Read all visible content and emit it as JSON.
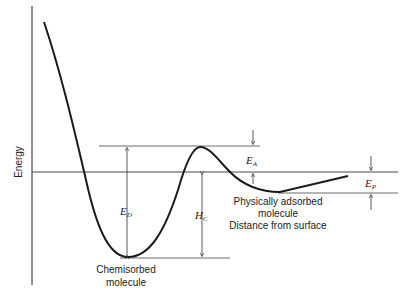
{
  "diagram": {
    "type": "potential-energy-curve",
    "y_axis_label": "Energy",
    "x_axis_label": "Distance from surface",
    "labels": {
      "chemisorbed": [
        "Chemisorbed",
        "molecule"
      ],
      "physisorbed": [
        "Physically adsorbed",
        "molecule"
      ]
    },
    "symbols": {
      "ED": {
        "main": "E",
        "sub": "D"
      },
      "HC": {
        "main": "H",
        "sub": "C"
      },
      "EA": {
        "main": "E",
        "sub": "A"
      },
      "EP": {
        "main": "E",
        "sub": "P"
      }
    },
    "colors": {
      "line": "#1a1a1a",
      "guide": "#555555"
    }
  }
}
